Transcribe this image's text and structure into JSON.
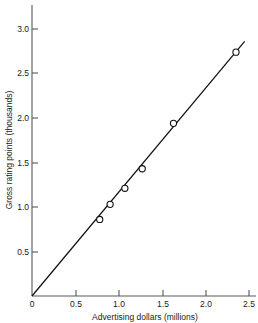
{
  "chart_data": {
    "type": "scatter",
    "title": "",
    "subtitle": "",
    "xlabel": "Advertising dollars (millions)",
    "ylabel": "Gross rating points (thousands)",
    "xlim": [
      0,
      2.6
    ],
    "ylim": [
      0,
      3.15
    ],
    "grid": false,
    "legend": null,
    "xticks": [
      0,
      0.5,
      1.0,
      1.5,
      2.0,
      2.5
    ],
    "xticklabels": [
      "0",
      "0.5",
      "1.0",
      "1.5",
      "2.0",
      "2.5"
    ],
    "yticks": [
      0,
      0.5,
      1.0,
      1.5,
      2.0,
      2.5,
      3.0
    ],
    "yticklabels": [
      "0",
      "0.5",
      "1.0",
      "1.5",
      "2.0",
      "2.5",
      "3.0"
    ],
    "series": [
      {
        "name": "Observations",
        "marker": "open-circle",
        "x": [
          0.78,
          0.9,
          1.07,
          1.27,
          1.63,
          2.35
        ],
        "y": [
          0.86,
          1.03,
          1.21,
          1.43,
          1.94,
          2.74
        ]
      }
    ],
    "fit_line": {
      "name": "Fitted regression line",
      "x": [
        0.0,
        2.45
      ],
      "y": [
        0.0,
        2.86
      ],
      "slope": 1.167,
      "intercept": 0.0
    }
  },
  "axes": {
    "x_title": "Advertising dollars (millions)",
    "y_title": "Gross rating points (thousands)"
  }
}
